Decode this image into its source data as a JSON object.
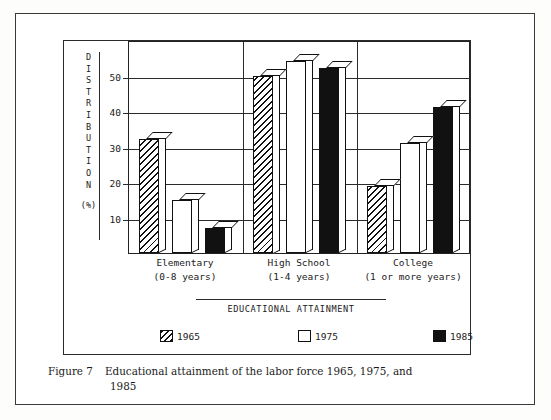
{
  "figure": {
    "caption_label": "Figure 7",
    "caption_line1": "Educational attainment of the labor force 1965, 1975, and",
    "caption_line2": "1985"
  },
  "axis": {
    "ylabel_letters": [
      "D",
      "I",
      "S",
      "T",
      "R",
      "I",
      "B",
      "U",
      "T",
      "I",
      "O",
      "N"
    ],
    "ylabel_text": "DISTRIBUTION",
    "yunit": "(%)",
    "xtitle": "EDUCATIONAL ATTAINMENT",
    "yticks": [
      10,
      20,
      30,
      40,
      50
    ],
    "ytick_labels": [
      "10",
      "20",
      "30",
      "40",
      "50"
    ]
  },
  "legend": [
    {
      "label": "1965",
      "style": "hatch"
    },
    {
      "label": "1975",
      "style": "white"
    },
    {
      "label": "1985",
      "style": "black"
    }
  ],
  "categories": [
    {
      "line1": "Elementary",
      "line2": "(0-8 years)"
    },
    {
      "line1": "High School",
      "line2": "(1-4 years)"
    },
    {
      "line1": "College",
      "line2": "(1 or more years)"
    }
  ],
  "colors": {
    "ink": "#111111",
    "frame": "#2b2b2b",
    "paper": "#ffffff",
    "series_1965": "#ffffff",
    "series_1975": "#ffffff",
    "series_1985": "#111111"
  },
  "chart_data": {
    "type": "bar",
    "title": "Educational attainment of the labor force 1965, 1975, and 1985",
    "xlabel": "EDUCATIONAL ATTAINMENT",
    "ylabel": "DISTRIBUTION (%)",
    "ylim": [
      0,
      60
    ],
    "yticks": [
      10,
      20,
      30,
      40,
      50
    ],
    "grid": true,
    "legend_position": "bottom",
    "categories": [
      "Elementary (0-8 years)",
      "High School (1-4 years)",
      "College (1 or more years)"
    ],
    "series": [
      {
        "name": "1965",
        "values": [
          32,
          50,
          19
        ]
      },
      {
        "name": "1975",
        "values": [
          15,
          54,
          31
        ]
      },
      {
        "name": "1985",
        "values": [
          7,
          52,
          41
        ]
      }
    ]
  }
}
